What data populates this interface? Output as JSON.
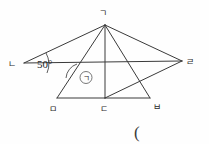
{
  "figure": {
    "type": "geometry-diagram",
    "background_color": "#fefefe",
    "stroke_color": "#3a3a3a",
    "text_color": "#2b2b2b",
    "vertices": [
      {
        "id": "apex",
        "label": "ㄱ",
        "x": 105,
        "y": 25,
        "label_x": 103,
        "label_y": 16
      },
      {
        "id": "left",
        "label": "ㄴ",
        "x": 24,
        "y": 63,
        "label_x": 12,
        "label_y": 67
      },
      {
        "id": "right",
        "label": "ㄹ",
        "x": 182,
        "y": 61,
        "label_x": 186,
        "label_y": 65
      },
      {
        "id": "bottom-left",
        "label": "ㅁ",
        "x": 57,
        "y": 98,
        "label_x": 53,
        "label_y": 110
      },
      {
        "id": "bottom-mid",
        "label": "ㄷ",
        "x": 105,
        "y": 98,
        "label_x": 101,
        "label_y": 110
      },
      {
        "id": "bottom-right",
        "label": "ㅂ",
        "x": 150,
        "y": 98,
        "label_x": 154,
        "label_y": 108
      }
    ],
    "segments": [
      {
        "name": "apex-to-left",
        "from": "apex",
        "to": "left"
      },
      {
        "name": "apex-to-right",
        "from": "apex",
        "to": "right"
      },
      {
        "name": "left-to-right",
        "from": "left",
        "to": "right"
      },
      {
        "name": "apex-to-bottom-left",
        "from": "apex",
        "to": "bottom-left"
      },
      {
        "name": "apex-to-bottom-right",
        "from": "apex",
        "to": "bottom-right"
      },
      {
        "name": "bottom-left-to-bottom-mid",
        "from": "bottom-left",
        "to": "bottom-mid"
      },
      {
        "name": "bottom-mid-to-bottom-right",
        "from": "bottom-mid",
        "to": "bottom-right"
      },
      {
        "name": "bottom-mid-to-apex",
        "from": "bottom-mid",
        "to": "apex"
      },
      {
        "name": "bottom-mid-to-right",
        "from": "bottom-mid",
        "to": "right"
      }
    ],
    "angles": [
      {
        "name": "angle-at-left-vertex",
        "value_text": "50°",
        "degrees": 50,
        "text_x": 36,
        "text_y": 67,
        "arc_cx": 24,
        "arc_cy": 63
      },
      {
        "name": "marked-angle",
        "marker_label": "ㄱ",
        "marker_x": 86,
        "marker_y": 80,
        "circle_cx": 86,
        "circle_cy": 77.5,
        "circle_r": 6
      }
    ],
    "annotations": [
      {
        "name": "open-paren",
        "text": "(",
        "x": 134,
        "y": 136
      }
    ]
  }
}
